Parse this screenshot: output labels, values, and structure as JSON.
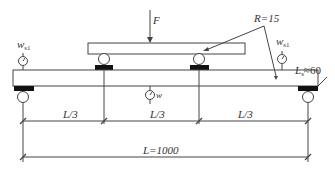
{
  "diagram": {
    "colors": {
      "line": "#444444",
      "fill_dark": "#111111",
      "background": "#ffffff"
    },
    "labels": {
      "force": "F",
      "roller_radius": "R=15",
      "deflection_support_left": {
        "main": "w",
        "sub": "s1"
      },
      "deflection_support_right": {
        "main": "w",
        "sub": "s1"
      },
      "deflection_midspan": "w",
      "support_length": {
        "main": "L",
        "sub": "s",
        "value": "≈60"
      },
      "span_third_1": "L/3",
      "span_third_2": "L/3",
      "span_third_3": "L/3",
      "total_span": "L=1000"
    },
    "components": [
      {
        "name": "loading-beam",
        "type": "upper spreader beam"
      },
      {
        "name": "load-roller-left",
        "type": "roller"
      },
      {
        "name": "load-roller-right",
        "type": "roller"
      },
      {
        "name": "specimen-beam",
        "type": "test beam"
      },
      {
        "name": "support-roller-left",
        "type": "roller"
      },
      {
        "name": "support-roller-right",
        "type": "roller"
      },
      {
        "name": "dial-gauge-left",
        "type": "dial gauge"
      },
      {
        "name": "dial-gauge-right",
        "type": "dial gauge"
      },
      {
        "name": "dial-gauge-mid",
        "type": "dial gauge"
      }
    ]
  }
}
